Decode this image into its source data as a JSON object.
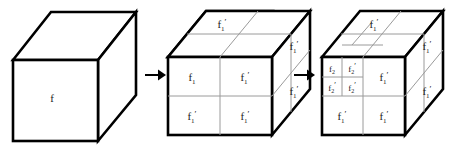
{
  "figure": {
    "background": "#ffffff",
    "outline_color": "#000000",
    "grid_color": "#9a9a9a",
    "label_color": "#1a1a1a",
    "arrow_color": "#000000",
    "stages": [
      {
        "name": "stage-1",
        "caption": "undivided cube",
        "front_labels": [
          {
            "id": "s1-front",
            "base": "f",
            "sub": "",
            "prime": ""
          }
        ],
        "top_labels": [],
        "right_labels": []
      },
      {
        "name": "stage-2",
        "caption": "cube divided once into 2x2x2",
        "front_labels": [
          {
            "id": "s2-front-tl",
            "base": "f",
            "sub": "1",
            "prime": ""
          },
          {
            "id": "s2-front-tr",
            "base": "f",
            "sub": "1",
            "prime": "′"
          },
          {
            "id": "s2-front-bl",
            "base": "f",
            "sub": "1",
            "prime": "′"
          },
          {
            "id": "s2-front-br",
            "base": "f",
            "sub": "1",
            "prime": "′"
          }
        ],
        "top_labels": [
          {
            "id": "s2-top",
            "base": "f",
            "sub": "1",
            "prime": "′"
          }
        ],
        "right_labels": [
          {
            "id": "s2-right-top",
            "base": "f",
            "sub": "1",
            "prime": "′"
          },
          {
            "id": "s2-right-bottom",
            "base": "f",
            "sub": "1",
            "prime": "′"
          }
        ]
      },
      {
        "name": "stage-3",
        "caption": "upper-left cell further divided into 2x2x2",
        "front_labels": [
          {
            "id": "s3-front-sub-tl",
            "base": "f",
            "sub": "2",
            "prime": ""
          },
          {
            "id": "s3-front-sub-tr",
            "base": "f",
            "sub": "2",
            "prime": "′"
          },
          {
            "id": "s3-front-sub-bl",
            "base": "f",
            "sub": "2",
            "prime": "′"
          },
          {
            "id": "s3-front-sub-br",
            "base": "f",
            "sub": "2",
            "prime": "′"
          },
          {
            "id": "s3-front-tr",
            "base": "f",
            "sub": "1",
            "prime": "′"
          },
          {
            "id": "s3-front-bl",
            "base": "f",
            "sub": "1",
            "prime": "′"
          },
          {
            "id": "s3-front-br",
            "base": "f",
            "sub": "1",
            "prime": "′"
          }
        ],
        "top_labels": [
          {
            "id": "s3-top",
            "base": "f",
            "sub": "1",
            "prime": "′"
          }
        ],
        "right_labels": [
          {
            "id": "s3-right-top",
            "base": "f",
            "sub": "1",
            "prime": "′"
          },
          {
            "id": "s3-right-bottom",
            "base": "f",
            "sub": "1",
            "prime": "′"
          }
        ]
      }
    ],
    "arrows": [
      {
        "id": "arrow-1",
        "glyph": "→",
        "from": "stage-1",
        "to": "stage-2"
      },
      {
        "id": "arrow-2",
        "glyph": "→",
        "from": "stage-2",
        "to": "stage-3"
      }
    ]
  }
}
